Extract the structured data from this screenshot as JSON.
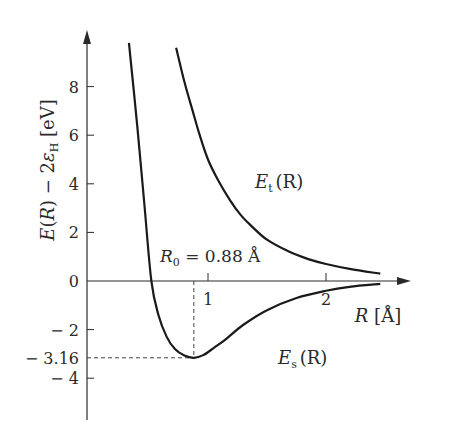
{
  "chart_data": {
    "type": "line",
    "title": "",
    "xlabel": "R [Å]",
    "ylabel": "E(R) − 2ε_H [eV]",
    "xlim": [
      0,
      2.7
    ],
    "ylim": [
      -5.5,
      10
    ],
    "x_ticks": [
      {
        "value": 1,
        "label": "1"
      },
      {
        "value": 2,
        "label": "2"
      }
    ],
    "y_ticks": [
      {
        "value": 8,
        "label": "8"
      },
      {
        "value": 6,
        "label": "6"
      },
      {
        "value": 4,
        "label": "4"
      },
      {
        "value": 2,
        "label": "2"
      },
      {
        "value": 0,
        "label": "0"
      },
      {
        "value": -2,
        "label": "− 2"
      },
      {
        "value": -3.16,
        "label": "− 3.16"
      },
      {
        "value": -4,
        "label": "− 4"
      }
    ],
    "grid": false,
    "series": [
      {
        "name": "E_s(R)",
        "label_main": "E",
        "label_sub": "s",
        "label_arg": "(R)",
        "points": [
          [
            0.33,
            9.8
          ],
          [
            0.4,
            6.4
          ],
          [
            0.46,
            3.2
          ],
          [
            0.52,
            0.0
          ],
          [
            0.58,
            -1.4
          ],
          [
            0.65,
            -2.3
          ],
          [
            0.72,
            -2.8
          ],
          [
            0.8,
            -3.07
          ],
          [
            0.88,
            -3.16
          ],
          [
            0.96,
            -3.05
          ],
          [
            1.05,
            -2.75
          ],
          [
            1.15,
            -2.4
          ],
          [
            1.3,
            -1.8
          ],
          [
            1.5,
            -1.2
          ],
          [
            1.75,
            -0.7
          ],
          [
            2.0,
            -0.4
          ],
          [
            2.2,
            -0.24
          ],
          [
            2.46,
            -0.12
          ]
        ]
      },
      {
        "name": "E_t(R)",
        "label_main": "E",
        "label_sub": "t",
        "label_arg": "(R)",
        "points": [
          [
            0.73,
            9.6
          ],
          [
            0.8,
            8.2
          ],
          [
            0.87,
            7.0
          ],
          [
            0.93,
            6.0
          ],
          [
            1.0,
            5.0
          ],
          [
            1.08,
            4.2
          ],
          [
            1.19,
            3.3
          ],
          [
            1.28,
            2.7
          ],
          [
            1.36,
            2.3
          ],
          [
            1.5,
            1.7
          ],
          [
            1.69,
            1.2
          ],
          [
            1.85,
            0.9
          ],
          [
            2.0,
            0.7
          ],
          [
            2.2,
            0.5
          ],
          [
            2.46,
            0.3
          ]
        ]
      }
    ],
    "annotations": [
      {
        "text_main": "R",
        "text_sub": "0",
        "text_rest": " = 0.88 Å",
        "x": 0.88,
        "y": -3.16,
        "kind": "minimum-marker"
      }
    ]
  }
}
